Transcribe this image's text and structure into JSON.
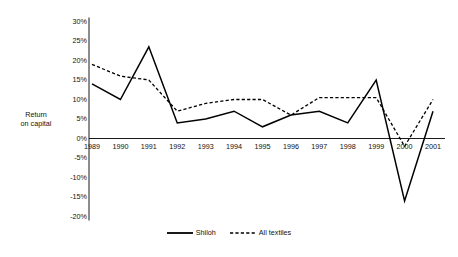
{
  "chart_data": {
    "type": "line",
    "title": "",
    "xlabel": "",
    "ylabel": "Return on capital",
    "ylabel_line1": "Return",
    "ylabel_line2": "on capital",
    "categories": [
      "1989",
      "1990",
      "1991",
      "1992",
      "1993",
      "1994",
      "1995",
      "1996",
      "1997",
      "1998",
      "1999",
      "2000",
      "2001"
    ],
    "ylim": [
      -20,
      30
    ],
    "ytick_labels": [
      "30%",
      "25%",
      "20%",
      "15%",
      "10%",
      "5%",
      "0%",
      "-5%",
      "-10%",
      "-15%",
      "-20%"
    ],
    "ytick_values": [
      30,
      25,
      20,
      15,
      10,
      5,
      0,
      -5,
      -10,
      -15,
      -20
    ],
    "grid": false,
    "legend_position": "bottom-center",
    "series": [
      {
        "name": "Shiloh",
        "style": "solid",
        "color": "#000000",
        "values": [
          14,
          10,
          23.5,
          4,
          5,
          7,
          3,
          6,
          7,
          4,
          15,
          -16,
          7
        ]
      },
      {
        "name": "All textiles",
        "style": "dashed",
        "color": "#000000",
        "values": [
          19,
          16,
          15,
          7,
          9,
          10,
          10,
          6,
          10.5,
          10.5,
          10.5,
          -2,
          10
        ]
      }
    ]
  },
  "legend": {
    "items": [
      {
        "label": "Shiloh",
        "style": "solid"
      },
      {
        "label": "All textiles",
        "style": "dashed"
      }
    ]
  }
}
